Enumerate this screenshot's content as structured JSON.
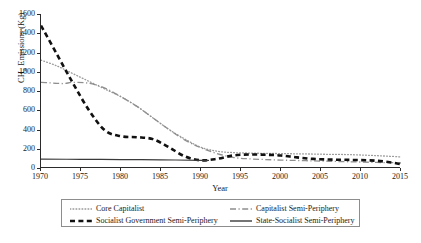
{
  "chart_data": {
    "type": "line",
    "title": "",
    "xlabel": "Year",
    "ylabel": "CH4 Emissions (Kg)",
    "ylabel_base": "CH",
    "ylabel_sub": "4",
    "ylabel_rest": " Emissions (Kg)",
    "xlim": [
      1970,
      2015
    ],
    "ylim": [
      0,
      1600
    ],
    "xticks": [
      1970,
      1975,
      1980,
      1985,
      1990,
      1995,
      2000,
      2005,
      2010,
      2015
    ],
    "yticks": [
      0,
      200,
      400,
      600,
      800,
      1000,
      1200,
      1400,
      1600
    ],
    "grid": false,
    "legend_position": "below-axes",
    "series": [
      {
        "name": "Core Capitalist",
        "style": "dotted",
        "color": "#9a9a9a",
        "width": 1.3,
        "x": [
          1970,
          1972,
          1974,
          1976,
          1978,
          1980,
          1982,
          1984,
          1986,
          1988,
          1990,
          1992,
          1994,
          1996,
          1998,
          2000,
          2002,
          2004,
          2006,
          2008,
          2010,
          2012,
          2014,
          2015
        ],
        "y": [
          1120,
          1060,
          980,
          900,
          820,
          740,
          640,
          520,
          400,
          300,
          215,
          175,
          160,
          155,
          152,
          150,
          147,
          145,
          142,
          140,
          135,
          128,
          120,
          115
        ]
      },
      {
        "name": "Capitalist Semi-Periphery",
        "style": "dashdot",
        "color": "#8f8f8f",
        "width": 1.3,
        "x": [
          1970,
          1971,
          1972,
          1973,
          1974,
          1976,
          1978,
          1980,
          1982,
          1984,
          1986,
          1988,
          1990,
          1992,
          1994,
          1996,
          1998,
          2000,
          2002,
          2004,
          2006,
          2008,
          2010,
          2012,
          2014,
          2015
        ],
        "y": [
          890,
          885,
          880,
          878,
          890,
          880,
          830,
          740,
          640,
          520,
          400,
          290,
          210,
          150,
          110,
          95,
          88,
          82,
          78,
          74,
          70,
          66,
          62,
          58,
          55,
          52
        ]
      },
      {
        "name": "Socialist Government Semi-Periphery",
        "style": "dashed",
        "color": "#111111",
        "width": 2.6,
        "x": [
          1970,
          1972,
          1974,
          1976,
          1978,
          1980,
          1982,
          1984,
          1986,
          1988,
          1990,
          1992,
          1994,
          1996,
          1998,
          2000,
          2002,
          2004,
          2006,
          2008,
          2010,
          2012,
          2014,
          2015
        ],
        "y": [
          1480,
          1180,
          880,
          600,
          390,
          330,
          320,
          300,
          215,
          120,
          80,
          95,
          130,
          140,
          138,
          130,
          110,
          95,
          88,
          85,
          82,
          75,
          55,
          40
        ]
      },
      {
        "name": "State-Socialist Semi-Periphery",
        "style": "solid",
        "color": "#3a3a3a",
        "width": 1.2,
        "x": [
          1970,
          1975,
          1980,
          1985,
          1990,
          1991
        ],
        "y": [
          92,
          90,
          88,
          85,
          80,
          78
        ]
      }
    ]
  },
  "legend": {
    "entries": [
      {
        "label": "Core Capitalist",
        "style": "dotted",
        "color": "#9a9a9a"
      },
      {
        "label": "Capitalist Semi-Periphery",
        "style": "dashdot",
        "color": "#8f8f8f"
      },
      {
        "label": "Socialist Government Semi-Periphery",
        "style": "dashed",
        "color": "#111111"
      },
      {
        "label": "State-Socialist Semi-Periphery",
        "style": "solid",
        "color": "#3a3a3a"
      }
    ]
  }
}
